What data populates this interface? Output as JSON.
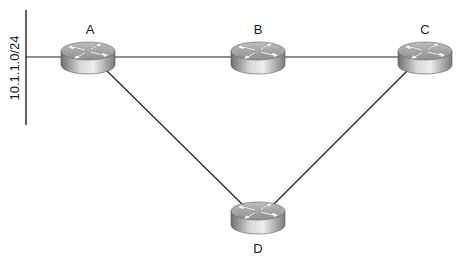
{
  "diagram": {
    "type": "network-topology",
    "segment": {
      "label": "10.1.1.0/24"
    },
    "routers": [
      {
        "id": "A",
        "label": "A",
        "x": 88,
        "y": 57
      },
      {
        "id": "B",
        "label": "B",
        "x": 258,
        "y": 57
      },
      {
        "id": "C",
        "label": "C",
        "x": 425,
        "y": 57
      },
      {
        "id": "D",
        "label": "D",
        "x": 258,
        "y": 217
      }
    ],
    "links": [
      {
        "from": "segment",
        "to": "A"
      },
      {
        "from": "A",
        "to": "B"
      },
      {
        "from": "B",
        "to": "C"
      },
      {
        "from": "A",
        "to": "D"
      },
      {
        "from": "C",
        "to": "D"
      }
    ]
  }
}
